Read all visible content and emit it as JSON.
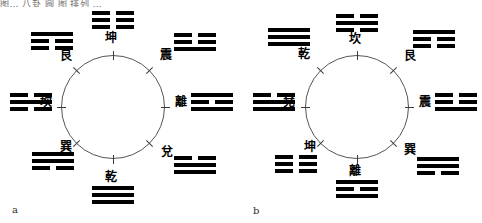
{
  "page": {
    "top_partial_text": "图… 八卦 圆 图 排列 …",
    "background_color": "#ffffff",
    "ink_color": "#000000",
    "circle_stroke_color": "#555555"
  },
  "figures": [
    {
      "id": "a",
      "caption": "a",
      "circle": {
        "cx": 113,
        "cy": 107,
        "r": 52
      },
      "nodes": [
        {
          "name": "kun",
          "label": "坤",
          "angle_deg": 90,
          "lines": [
            "broken",
            "broken",
            "broken"
          ],
          "trigram_left": 92,
          "trigram_top": 11,
          "label_left": 105,
          "label_top": 32
        },
        {
          "name": "zhen",
          "label": "震",
          "angle_deg": 45,
          "lines": [
            "broken",
            "broken",
            "solid"
          ],
          "trigram_left": 174,
          "trigram_top": 33,
          "label_left": 160,
          "label_top": 49
        },
        {
          "name": "li",
          "label": "離",
          "angle_deg": 0,
          "lines": [
            "solid",
            "broken",
            "solid"
          ],
          "trigram_left": 191,
          "trigram_top": 93,
          "label_left": 175,
          "label_top": 96
        },
        {
          "name": "dui",
          "label": "兌",
          "angle_deg": -45,
          "lines": [
            "broken",
            "solid",
            "solid"
          ],
          "trigram_left": 174,
          "trigram_top": 156,
          "label_left": 161,
          "label_top": 146
        },
        {
          "name": "qian",
          "label": "乾",
          "angle_deg": -90,
          "lines": [
            "solid",
            "solid",
            "solid"
          ],
          "trigram_left": 92,
          "trigram_top": 186,
          "label_left": 105,
          "label_top": 171
        },
        {
          "name": "xun",
          "label": "巽",
          "angle_deg": -135,
          "lines": [
            "solid",
            "solid",
            "broken"
          ],
          "trigram_left": 32,
          "trigram_top": 152,
          "label_left": 60,
          "label_top": 141
        },
        {
          "name": "kan",
          "label": "坎",
          "angle_deg": 180,
          "lines": [
            "broken",
            "solid",
            "broken"
          ],
          "trigram_left": 10,
          "trigram_top": 93,
          "label_left": 40,
          "label_top": 96
        },
        {
          "name": "gen",
          "label": "艮",
          "angle_deg": 135,
          "lines": [
            "solid",
            "broken",
            "broken"
          ],
          "trigram_left": 31,
          "trigram_top": 32,
          "label_left": 60,
          "label_top": 50
        }
      ]
    },
    {
      "id": "b",
      "caption": "b",
      "circle": {
        "cx": 116,
        "cy": 107,
        "r": 52
      },
      "nodes": [
        {
          "name": "kan",
          "label": "坎",
          "angle_deg": 90,
          "lines": [
            "broken",
            "solid",
            "broken"
          ],
          "trigram_left": 95,
          "trigram_top": 14,
          "label_left": 108,
          "label_top": 33
        },
        {
          "name": "gen",
          "label": "艮",
          "angle_deg": 45,
          "lines": [
            "solid",
            "broken",
            "broken"
          ],
          "trigram_left": 172,
          "trigram_top": 30,
          "label_left": 163,
          "label_top": 50
        },
        {
          "name": "zhen",
          "label": "震",
          "angle_deg": 0,
          "lines": [
            "broken",
            "broken",
            "solid"
          ],
          "trigram_left": 194,
          "trigram_top": 93,
          "label_left": 178,
          "label_top": 96
        },
        {
          "name": "xun",
          "label": "巽",
          "angle_deg": -45,
          "lines": [
            "solid",
            "solid",
            "broken"
          ],
          "trigram_left": 176,
          "trigram_top": 157,
          "label_left": 163,
          "label_top": 144
        },
        {
          "name": "li",
          "label": "離",
          "angle_deg": -90,
          "lines": [
            "solid",
            "broken",
            "solid"
          ],
          "trigram_left": 95,
          "trigram_top": 180,
          "label_left": 108,
          "label_top": 165
        },
        {
          "name": "kun",
          "label": "坤",
          "angle_deg": -135,
          "lines": [
            "broken",
            "broken",
            "broken"
          ],
          "trigram_left": 34,
          "trigram_top": 155,
          "label_left": 63,
          "label_top": 141
        },
        {
          "name": "dui",
          "label": "兌",
          "angle_deg": 180,
          "lines": [
            "broken",
            "solid",
            "solid"
          ],
          "trigram_left": 12,
          "trigram_top": 93,
          "label_left": 42,
          "label_top": 96
        },
        {
          "name": "qian",
          "label": "乾",
          "angle_deg": 135,
          "lines": [
            "solid",
            "solid",
            "solid"
          ],
          "trigram_left": 27,
          "trigram_top": 28,
          "label_left": 57,
          "label_top": 48
        }
      ]
    }
  ],
  "captions": {
    "a": {
      "text": "a",
      "left": 12,
      "top": 205
    },
    "b": {
      "text": "b",
      "left": 253,
      "top": 206
    }
  }
}
